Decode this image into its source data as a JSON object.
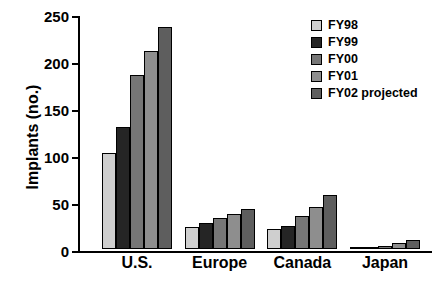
{
  "chart_data": {
    "type": "bar",
    "title": "",
    "xlabel": "",
    "ylabel": "Implants (no.)",
    "categories": [
      "U.S.",
      "Europe",
      "Canada",
      "Japan"
    ],
    "series": [
      {
        "name": "FY98",
        "color": "#cfcfcf",
        "values": [
          102,
          23,
          21,
          1
        ]
      },
      {
        "name": "FY99",
        "color": "#252525",
        "values": [
          130,
          28,
          24,
          2
        ]
      },
      {
        "name": "FY00",
        "color": "#767676",
        "values": [
          185,
          33,
          35,
          3
        ]
      },
      {
        "name": "FY01",
        "color": "#8e8e8e",
        "values": [
          211,
          37,
          45,
          6
        ]
      },
      {
        "name": "FY02 projected",
        "color": "#5e5e5e",
        "values": [
          236,
          43,
          57,
          10
        ]
      }
    ],
    "ylim": [
      0,
      250
    ],
    "yticks": [
      0,
      50,
      100,
      150,
      200,
      250
    ],
    "ytick_labels": [
      "0",
      "50",
      "100",
      "150",
      "200",
      "250"
    ],
    "grid": false,
    "legend_position": "top-right",
    "axis_color": "#000000",
    "background": "#ffffff"
  }
}
